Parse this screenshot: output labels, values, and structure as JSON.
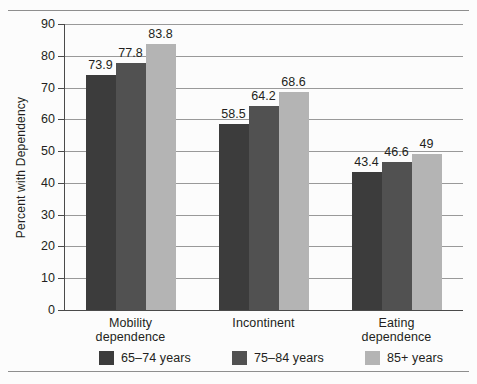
{
  "chart_data": {
    "type": "bar",
    "title": "",
    "xlabel": "",
    "ylabel": "Percent with Dependency",
    "ylim": [
      0,
      90
    ],
    "ytick_step": 10,
    "yticks": [
      "90",
      "80",
      "70",
      "60",
      "50",
      "40",
      "30",
      "20",
      "10",
      "0"
    ],
    "grid": true,
    "legend_position": "bottom",
    "categories": [
      "Mobility dependence",
      "Incontinent",
      "Eating dependence"
    ],
    "category_lines": [
      [
        "Mobility",
        "dependence"
      ],
      [
        "Incontinent",
        ""
      ],
      [
        "Eating",
        "dependence"
      ]
    ],
    "series": [
      {
        "name": "65–74 years",
        "color": "#3c3c3c",
        "values": [
          73.9,
          58.5,
          43.4
        ],
        "labels": [
          "73.9",
          "58.5",
          "43.4"
        ]
      },
      {
        "name": "75–84 years",
        "color": "#515151",
        "values": [
          77.8,
          64.2,
          46.6
        ],
        "labels": [
          "77.8",
          "64.2",
          "46.6"
        ]
      },
      {
        "name": "85+ years",
        "color": "#b4b4b4",
        "values": [
          83.8,
          68.6,
          49.0
        ],
        "labels": [
          "83.8",
          "68.6",
          "49"
        ]
      }
    ]
  },
  "colors": {
    "background": "#fcfcfc",
    "axis": "#4a4a4a",
    "gridline": "#999999",
    "rule": "#8e8e8e",
    "text": "#231f20",
    "series_1": "#3c3c3c",
    "series_2": "#515151",
    "series_3": "#b4b4b4"
  }
}
